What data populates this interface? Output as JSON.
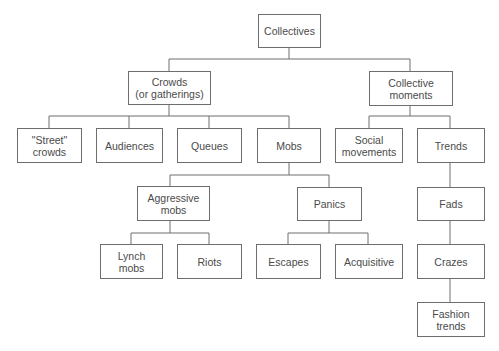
{
  "diagram": {
    "title": "Collectives",
    "nodes": {
      "collectives": "Collectives",
      "crowds": "Crowds\n(or gatherings)",
      "collective_moments": "Collective\nmoments",
      "street_crowds": "\"Street\"\ncrowds",
      "audiences": "Audiences",
      "queues": "Queues",
      "mobs": "Mobs",
      "social_movements": "Social\nmovements",
      "trends": "Trends",
      "aggressive_mobs": "Aggressive\nmobs",
      "panics": "Panics",
      "fads": "Fads",
      "lynch_mobs": "Lynch\nmobs",
      "riots": "Riots",
      "escapes": "Escapes",
      "acquisitive": "Acquisitive",
      "crazes": "Crazes",
      "fashion_trends": "Fashion\ntrends"
    },
    "edges": [
      [
        "Collectives",
        "Crowds (or gatherings)"
      ],
      [
        "Collectives",
        "Collective moments"
      ],
      [
        "Crowds (or gatherings)",
        "\"Street\" crowds"
      ],
      [
        "Crowds (or gatherings)",
        "Audiences"
      ],
      [
        "Crowds (or gatherings)",
        "Queues"
      ],
      [
        "Crowds (or gatherings)",
        "Mobs"
      ],
      [
        "Collective moments",
        "Social movements"
      ],
      [
        "Collective moments",
        "Trends"
      ],
      [
        "Mobs",
        "Aggressive mobs"
      ],
      [
        "Mobs",
        "Panics"
      ],
      [
        "Aggressive mobs",
        "Lynch mobs"
      ],
      [
        "Aggressive mobs",
        "Riots"
      ],
      [
        "Panics",
        "Escapes"
      ],
      [
        "Panics",
        "Acquisitive"
      ],
      [
        "Trends",
        "Fads"
      ],
      [
        "Fads",
        "Crazes"
      ],
      [
        "Crazes",
        "Fashion trends"
      ]
    ],
    "colors": {
      "line": "#6e6e6e",
      "text": "#4a4a4a",
      "background": "#ffffff"
    }
  }
}
